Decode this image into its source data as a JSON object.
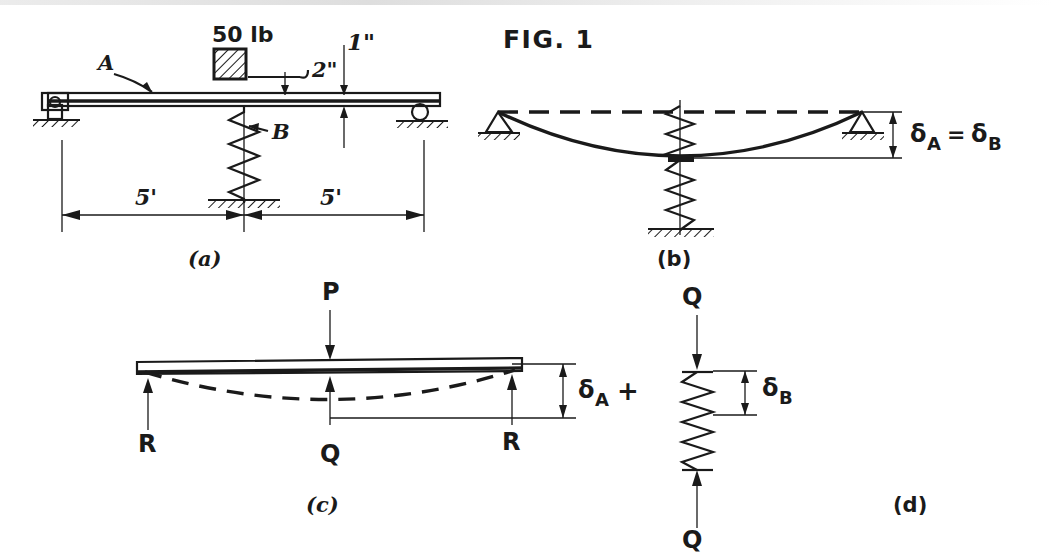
{
  "figure": {
    "title": "FIG. 1",
    "background_color": "#ffffff",
    "ink_color": "#1a1a1a",
    "panels": [
      {
        "id": "a",
        "caption": "(a)"
      },
      {
        "id": "b",
        "caption": "(b)"
      },
      {
        "id": "c",
        "caption": "(c)"
      },
      {
        "id": "d",
        "caption": "(d)"
      }
    ]
  },
  "panel_a": {
    "caption": "(a)",
    "load_label": "50 lb",
    "beam_label": "A",
    "spring_label": "B",
    "gap_label": "2\"",
    "deflection_label": "1\"",
    "dim_left": "5'",
    "dim_right": "5'",
    "left_support_type": "pin-support",
    "right_support_type": "roller-support",
    "ground_type": "hatched-ground"
  },
  "panel_b": {
    "caption": "(b)",
    "delta_equation": "δ",
    "delta_a_sub": "A",
    "delta_eq_sign": "=",
    "delta_b_sym": "δ",
    "delta_b_sub": "B",
    "delta_equation_full": "δA = δB",
    "undeformed_line_style": "dashed",
    "deformed_line_style": "solid-curve"
  },
  "panel_c": {
    "caption": "(c)",
    "load_top": "P",
    "reaction_left": "R",
    "reaction_right": "R",
    "spring_force": "Q",
    "delta_sym": "δ",
    "delta_sub": "A",
    "delta_label_full": "δA",
    "plus_sign": "+"
  },
  "panel_d": {
    "caption": "(d)",
    "force_top": "Q",
    "force_bottom": "Q",
    "delta_sym": "δ",
    "delta_sub": "B",
    "delta_label_full": "δB"
  }
}
